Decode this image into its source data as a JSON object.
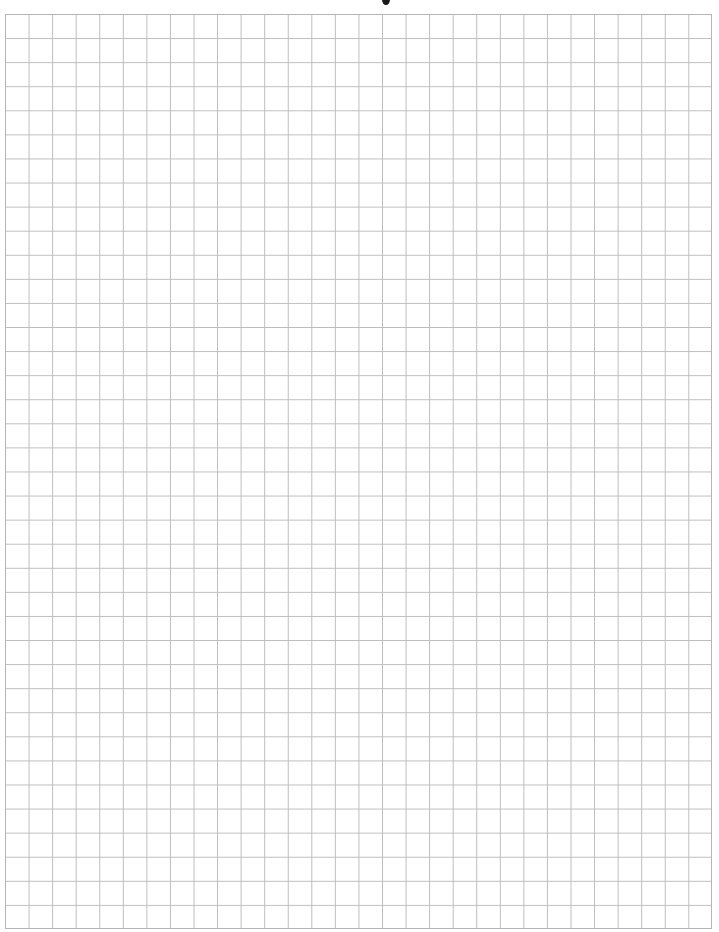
{
  "page": {
    "type": "graph-paper",
    "grid": {
      "columns": 30,
      "rows": 38,
      "line_color": "#bdbdbd",
      "background_color": "#ffffff"
    },
    "header_fragment": ""
  }
}
